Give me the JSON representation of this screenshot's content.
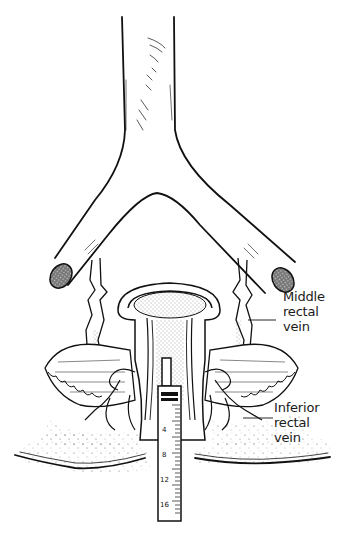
{
  "figure": {
    "background_color": "#ffffff",
    "line_color": "#111111"
  },
  "labels": {
    "middle_rectal_vein": {
      "line1": "Middle",
      "line2": "rectal",
      "line3": "vein"
    },
    "inferior_rectal_vein": {
      "line1": "Inferior",
      "line2": "rectal",
      "line3": "vein"
    }
  },
  "syringe": {
    "scale_marks": [
      "4",
      "8",
      "12",
      "16"
    ]
  }
}
